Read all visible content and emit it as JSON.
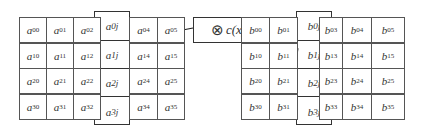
{
  "matrix_a": {
    "rows": [
      [
        "a00",
        "a01",
        "a02",
        "a03",
        "a04",
        "a05"
      ],
      [
        "a10",
        "a11",
        "a12",
        "a13",
        "a14",
        "a15"
      ],
      [
        "a20",
        "a21",
        "a22",
        "a23",
        "a24",
        "a25"
      ],
      [
        "a30",
        "a31",
        "a32",
        "a33",
        "a34",
        "a35"
      ]
    ],
    "column": [
      {
        "base": "a",
        "sub": "0j"
      },
      {
        "base": "a",
        "sub": "1j"
      },
      {
        "base": "a",
        "sub": "2j"
      },
      {
        "base": "a",
        "sub": "3j"
      }
    ]
  },
  "operator": {
    "symbol": "⊗",
    "label": "c(x)"
  },
  "matrix_b": {
    "rows": [
      [
        "b00",
        "b01",
        "b02",
        "b03",
        "b04",
        "b05"
      ],
      [
        "b10",
        "b11",
        "b12",
        "b13",
        "b14",
        "b15"
      ],
      [
        "b20",
        "b21",
        "b22",
        "b23",
        "b24",
        "b25"
      ],
      [
        "b30",
        "b31",
        "b32",
        "b33",
        "b34",
        "b35"
      ]
    ],
    "column": [
      {
        "base": "b",
        "sub": "0j"
      },
      {
        "base": "b",
        "sub": "1j"
      },
      {
        "base": "b",
        "sub": "2j"
      },
      {
        "base": "b",
        "sub": "3j"
      }
    ]
  }
}
